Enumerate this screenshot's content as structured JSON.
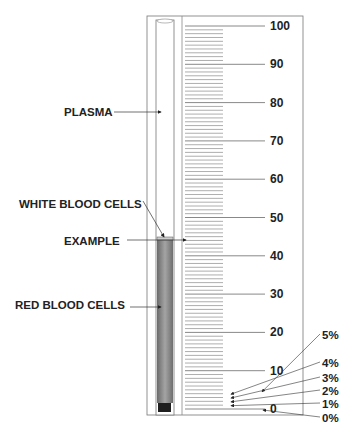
{
  "diagram": {
    "scale": {
      "min": 0,
      "max": 100,
      "major_step": 10,
      "minor_step": 1,
      "major_labels": [
        "100",
        "90",
        "80",
        "70",
        "60",
        "50",
        "40",
        "30",
        "20",
        "10",
        "0"
      ]
    },
    "labels": {
      "plasma": "PLASMA",
      "white_blood_cells": "WHITE BLOOD CELLS",
      "example": "EXAMPLE",
      "red_blood_cells": "RED BLOOD CELLS"
    },
    "percent_labels": [
      "5%",
      "4%",
      "3%",
      "2%",
      "1%",
      "0%"
    ],
    "example_value": 45,
    "colors": {
      "rbc": "#8a8a8a",
      "rbc_dark": "#5a5a5a",
      "plug": "#1e1e1e",
      "lines": "#666666",
      "frame": "#777777"
    }
  }
}
